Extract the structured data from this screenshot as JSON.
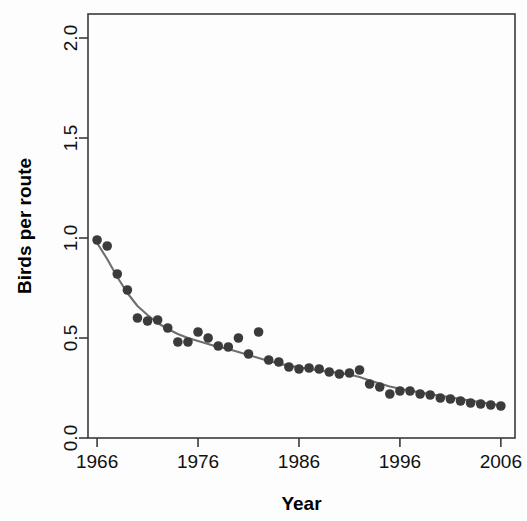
{
  "chart_data": {
    "type": "scatter",
    "title": "",
    "xlabel": "Year",
    "ylabel": "Birds per route",
    "xlim": [
      1965.1,
      2007.4
    ],
    "ylim": [
      0.0,
      2.12
    ],
    "xticks": [
      1966,
      1976,
      1986,
      1996,
      2006
    ],
    "xtick_labels": [
      "1966",
      "1976",
      "1986",
      "1996",
      "2006"
    ],
    "yticks": [
      0.0,
      0.5,
      1.0,
      1.5,
      2.0
    ],
    "ytick_labels": [
      "0.0",
      "0.5",
      "1.0",
      "1.5",
      "2.0"
    ],
    "grid": false,
    "legend": "none",
    "point_color": "#3b3b3b",
    "line_color": "#6e6e6e",
    "axis_color": "#3a3a3a",
    "point_radius": 4.8,
    "x": [
      1966,
      1967,
      1968,
      1969,
      1970,
      1971,
      1972,
      1973,
      1974,
      1975,
      1976,
      1977,
      1978,
      1979,
      1980,
      1981,
      1982,
      1983,
      1984,
      1985,
      1986,
      1987,
      1988,
      1989,
      1990,
      1991,
      1992,
      1993,
      1994,
      1995,
      1996,
      1997,
      1998,
      1999,
      2000,
      2001,
      2002,
      2003,
      2004,
      2005,
      2006
    ],
    "y": [
      0.99,
      0.96,
      0.82,
      0.74,
      0.6,
      0.585,
      0.59,
      0.55,
      0.48,
      0.48,
      0.53,
      0.5,
      0.46,
      0.455,
      0.5,
      0.42,
      0.53,
      0.39,
      0.38,
      0.355,
      0.345,
      0.35,
      0.345,
      0.33,
      0.32,
      0.325,
      0.34,
      0.27,
      0.255,
      0.22,
      0.235,
      0.235,
      0.22,
      0.215,
      0.2,
      0.195,
      0.185,
      0.175,
      0.17,
      0.165,
      0.16
    ],
    "trend": {
      "x": [
        1966,
        1967,
        1968,
        1969,
        1970,
        1971,
        1972,
        1973,
        1974,
        1975,
        1976,
        1977,
        1978,
        1979,
        1980,
        1981,
        1982,
        1983,
        1984,
        1985,
        1986,
        1987,
        1988,
        1989,
        1990,
        1991,
        1992,
        1993,
        1994,
        1995,
        1996,
        1997,
        1998,
        1999,
        2000,
        2001,
        2002,
        2003,
        2004,
        2005,
        2006
      ],
      "y": [
        0.975,
        0.895,
        0.805,
        0.725,
        0.66,
        0.615,
        0.575,
        0.545,
        0.52,
        0.5,
        0.485,
        0.47,
        0.455,
        0.445,
        0.43,
        0.415,
        0.4,
        0.385,
        0.372,
        0.362,
        0.353,
        0.345,
        0.338,
        0.332,
        0.325,
        0.317,
        0.305,
        0.288,
        0.272,
        0.258,
        0.246,
        0.236,
        0.228,
        0.219,
        0.211,
        0.203,
        0.195,
        0.187,
        0.179,
        0.171,
        0.163
      ]
    }
  },
  "figure": {
    "background": "#ffffff",
    "plot_left": 88,
    "plot_right": 515,
    "plot_top": 14,
    "plot_bottom": 438
  }
}
